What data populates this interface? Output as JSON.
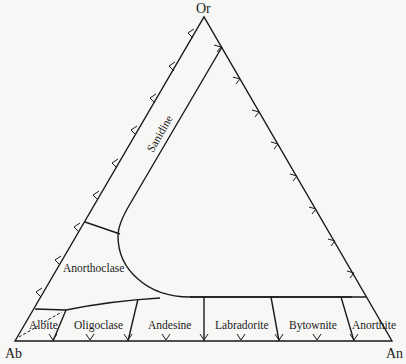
{
  "diagram": {
    "type": "ternary-phase-diagram",
    "vertices": {
      "top": "Or",
      "bottom_left": "Ab",
      "bottom_right": "An"
    },
    "fields": {
      "sanidine": "Sanidine",
      "anorthoclase": "Anorthoclase",
      "albite": "Albite",
      "oligoclase": "Oligoclase",
      "andesine": "Andesine",
      "labradorite": "Labradorite",
      "bytownite": "Bytownite",
      "anorthite": "Anorthite"
    },
    "plagioclase_series": [
      "Albite",
      "Oligoclase",
      "Andesine",
      "Labradorite",
      "Bytownite",
      "Anorthite"
    ],
    "alkali_feldspar_series": [
      "Sanidine",
      "Anorthoclase"
    ],
    "colors": {
      "line": "#1a1a1a",
      "background": "#f7f7f5"
    }
  }
}
